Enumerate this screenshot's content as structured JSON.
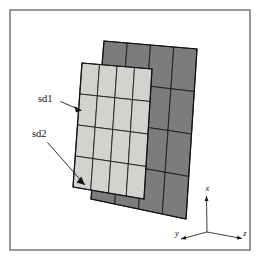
{
  "figure": {
    "background_color": "#ffffff",
    "frame": {
      "name": "figure-border",
      "x": 10,
      "y": 10,
      "width": 240,
      "height": 240,
      "stroke_color": "#6b6b6b"
    },
    "callouts": [
      {
        "id": "sd1",
        "label": "sd1",
        "text_x": 38,
        "text_y": 100,
        "line": "60.5,101.5 81.5,110.5",
        "arrow": "81.5,110.5 74.5,106.0 76.0,112.6"
      },
      {
        "id": "sd2",
        "label": "sd2",
        "text_x": 32,
        "text_y": 135,
        "line": "47.5,142.5 85.0,185.0",
        "arrow": "85.0,185.0 76.6,182.4 81.2,176.6"
      }
    ],
    "axes": {
      "name": "coordinate-triad",
      "origin_x": 207,
      "origin_y": 232,
      "x_axis": {
        "label": "x",
        "end_x": 206.5,
        "end_y": 196.0,
        "label_x": 207.5,
        "label_y": 189.5
      },
      "y_axis": {
        "label": "y",
        "end_x": 181.0,
        "end_y": 239.0,
        "label_x": 177.0,
        "label_y": 234.5
      },
      "z_axis": {
        "label": "z",
        "end_x": 242.0,
        "end_y": 238.5,
        "label_x": 245.0,
        "label_y": 234.5
      }
    },
    "meshes": [
      {
        "id": "sd2",
        "name": "coarse-background-mesh",
        "fill_color": "#7c7c7c",
        "rows": 4,
        "cols": 4,
        "corners": {
          "top_left": [
            104,
            41
          ],
          "top_right": [
            197,
            49
          ],
          "bottom_right": [
            186,
            219
          ],
          "bottom_left": [
            91,
            199
          ]
        }
      },
      {
        "id": "sd1",
        "name": "fine-overlay-mesh",
        "fill_color": "#d2d2cf",
        "rows": 4,
        "cols": 4,
        "corners": {
          "top_left": [
            82,
            63
          ],
          "top_right": [
            152,
            69
          ],
          "bottom_right": [
            144,
            199
          ],
          "bottom_left": [
            73,
            187
          ]
        }
      }
    ]
  }
}
